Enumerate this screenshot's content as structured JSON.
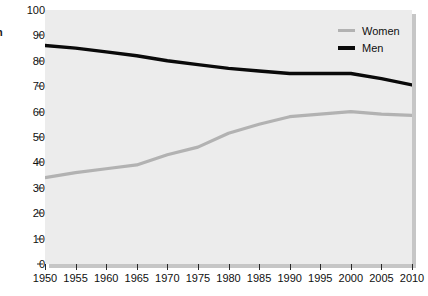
{
  "axis_title_clipped": "n",
  "legend": {
    "position": "top-right",
    "entries": [
      {
        "label": "Women",
        "color": "#b2b2b2",
        "swatch": "women-line-swatch"
      },
      {
        "label": "Men",
        "color": "#0a0a0a",
        "swatch": "men-line-swatch"
      }
    ]
  },
  "chart_data": {
    "type": "line",
    "title": "",
    "subtitle": "",
    "xlabel": "",
    "ylabel": "",
    "x": [
      1950,
      1955,
      1960,
      1965,
      1970,
      1975,
      1980,
      1985,
      1990,
      1995,
      2000,
      2005,
      2010
    ],
    "categories": [
      "1950",
      "1955",
      "1960",
      "1965",
      "1970",
      "1975",
      "1980",
      "1985",
      "1990",
      "1995",
      "2000",
      "2005",
      "2010"
    ],
    "series": [
      {
        "name": "Women",
        "color": "#b2b2b2",
        "values": [
          34,
          36,
          37.5,
          39,
          43,
          46,
          51.5,
          55,
          58,
          59,
          60,
          59,
          58.5
        ]
      },
      {
        "name": "Men",
        "color": "#0a0a0a",
        "values": [
          86,
          85,
          83.5,
          82,
          80,
          78.5,
          77,
          76,
          75,
          75,
          75,
          73,
          70.5
        ]
      }
    ],
    "xlim": [
      1950,
      2010
    ],
    "ylim": [
      0,
      100
    ],
    "yticks": [
      0,
      10,
      20,
      30,
      40,
      50,
      60,
      70,
      80,
      90,
      100
    ],
    "ytick_labels": [
      "0",
      "10",
      "20",
      "30",
      "40",
      "50",
      "60",
      "70",
      "80",
      "90",
      "100"
    ],
    "xticks": [
      1950,
      1955,
      1960,
      1965,
      1970,
      1975,
      1980,
      1985,
      1990,
      1995,
      2000,
      2005,
      2010
    ],
    "grid": false,
    "plot_background": "#ececec",
    "figure_background": "#ffffff"
  }
}
